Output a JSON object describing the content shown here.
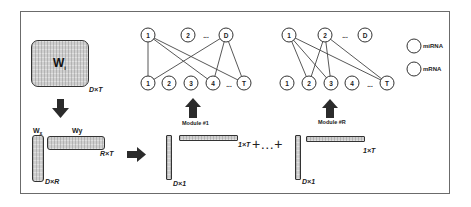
{
  "diagram": {
    "source_matrix": {
      "name": "W",
      "subscript": "i",
      "dim": "D×T"
    },
    "factors": {
      "left": {
        "name": "W",
        "subscript": "x",
        "dim": "D×R"
      },
      "right": {
        "name": "Wy",
        "dim": "R×T"
      }
    },
    "modules": [
      {
        "label": "Module #1",
        "column_dim": "D×1",
        "row_dim": "1×T",
        "top_nodes": [
          "1",
          "2",
          "...",
          "D"
        ],
        "bottom_nodes": [
          "1",
          "2",
          "3",
          "4",
          "...",
          "T"
        ]
      },
      {
        "label": "Module #R",
        "column_dim": "D×1",
        "row_dim": "1×T",
        "top_nodes": [
          "1",
          "2",
          "...",
          "D"
        ],
        "bottom_nodes": [
          "1",
          "2",
          "3",
          "4",
          "...",
          "T"
        ]
      }
    ],
    "sum_symbol": "+…+",
    "legend": [
      {
        "label": "miRNA"
      },
      {
        "label": "mRNA"
      }
    ]
  }
}
